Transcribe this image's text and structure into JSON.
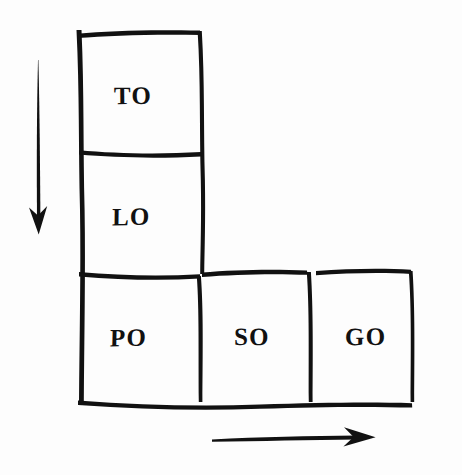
{
  "figure": {
    "kind": "hand-drawn-grid-diagram",
    "shape": "L-shape",
    "background_color": "#fdfdfd",
    "ink_color": "#111111"
  },
  "grid": {
    "cells": [
      {
        "id": "cell-to",
        "label": "TO",
        "row": 0,
        "col": 0
      },
      {
        "id": "cell-lo",
        "label": "LO",
        "row": 1,
        "col": 0
      },
      {
        "id": "cell-po",
        "label": "PO",
        "row": 2,
        "col": 0
      },
      {
        "id": "cell-so",
        "label": "SO",
        "row": 2,
        "col": 1
      },
      {
        "id": "cell-go",
        "label": "GO",
        "row": 2,
        "col": 2
      }
    ]
  },
  "arrows": {
    "vertical": {
      "name": "down-arrow",
      "direction": "down",
      "label": ""
    },
    "horizontal": {
      "name": "right-arrow",
      "direction": "right",
      "label": ""
    }
  }
}
